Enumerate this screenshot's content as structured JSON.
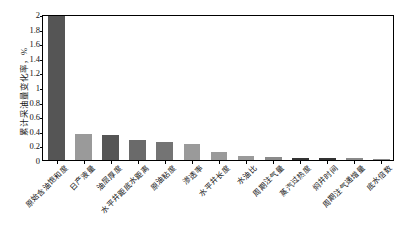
{
  "chart_data": {
    "type": "bar",
    "title": "",
    "xlabel": "",
    "ylabel": "累计采油量变化率，%",
    "ylim": [
      0,
      2
    ],
    "ytick_labels": [
      "2",
      "1.8",
      "1.6",
      "1.4",
      "1.2",
      "1",
      "0.8",
      "0.6",
      "0.4",
      "0.2",
      "0"
    ],
    "ytick_values": [
      2,
      1.8,
      1.6,
      1.4,
      1.2,
      1,
      0.8,
      0.6,
      0.4,
      0.2,
      0
    ],
    "grid": false,
    "legend": "none",
    "categories": [
      "原始含油饱和度",
      "日产液量",
      "油层厚度",
      "水平井距底水距离",
      "原油粘度",
      "渗透率",
      "水平井长度",
      "水油比",
      "周期注气量",
      "蒸汽过热度",
      "焖井时间",
      "周期注气递增量",
      "底水倍数"
    ],
    "values": [
      1.97,
      0.35,
      0.34,
      0.27,
      0.24,
      0.22,
      0.11,
      0.05,
      0.035,
      0.03,
      0.03,
      0.025,
      0.02
    ],
    "bar_colors": [
      "#555555",
      "#9a9a9a",
      "#555555",
      "#6a6a6a",
      "#747474",
      "#9a9a9a",
      "#9a9a9a",
      "#9a9a9a",
      "#8a8a8a",
      "#333333",
      "#333333",
      "#8a8a8a",
      "#8a8a8a"
    ]
  },
  "axis": {
    "line_color": "#000000"
  }
}
